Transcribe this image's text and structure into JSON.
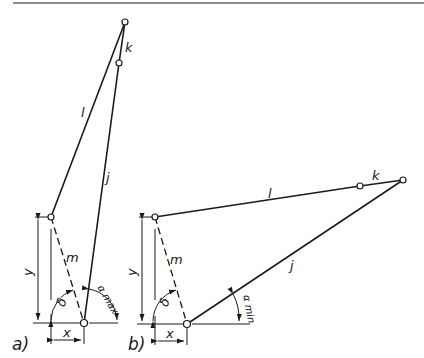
{
  "diagram": {
    "type": "linkage-mechanism",
    "panels": [
      {
        "id": "a",
        "label": "a)",
        "links": {
          "l": "l",
          "k": "k",
          "j": "j",
          "m": "m"
        },
        "dims": {
          "x": "x",
          "y": "y"
        },
        "angles": {
          "delta": "δ",
          "alpha": "α max"
        }
      },
      {
        "id": "b",
        "label": "b)",
        "links": {
          "l": "l",
          "k": "k",
          "j": "j",
          "m": "m"
        },
        "dims": {
          "x": "x",
          "y": "y"
        },
        "angles": {
          "delta": "δ",
          "alpha": "α min"
        }
      }
    ]
  },
  "colors": {
    "ink": "#1a1a1a",
    "background": "#ffffff"
  }
}
